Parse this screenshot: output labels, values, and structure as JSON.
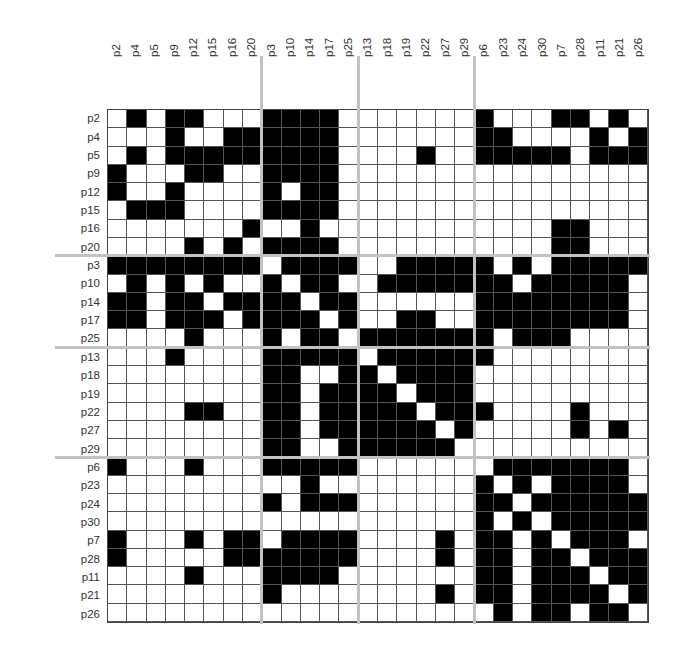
{
  "figure": {
    "type": "block-ordered binary adjacency matrix",
    "order": [
      "p2",
      "p4",
      "p5",
      "p9",
      "p12",
      "p15",
      "p16",
      "p20",
      "p3",
      "p10",
      "p14",
      "p17",
      "p25",
      "p13",
      "p18",
      "p19",
      "p22",
      "p27",
      "p29",
      "p6",
      "p23",
      "p24",
      "p30",
      "p7",
      "p28",
      "p11",
      "p21",
      "p26"
    ],
    "blocks": [
      {
        "start": 0,
        "size": 8
      },
      {
        "start": 8,
        "size": 5
      },
      {
        "start": 13,
        "size": 6
      },
      {
        "start": 19,
        "size": 9
      }
    ],
    "colors": {
      "filled": "#000000",
      "empty": "#ffffff",
      "separator": "#c2c2c2",
      "grid": "#555555"
    },
    "matrix": [
      "0101100011110000000100011010",
      "0001001111110000000110000101",
      "0101111111110000100111110111",
      "1000110011110000000000000000",
      "1001000010110000000000000000",
      "0111000011110000000000000000",
      "0000000100100000000000011000",
      "0000101011110000000000011000",
      "1111111101111001111101011111",
      "0101010010110011111110111110",
      "1101101111011000000111111110",
      "1101110111101001100111111110",
      "0000100010110111111101110000",
      "0001000011111011111100000000",
      "0000000011001101111000000000",
      "0000000011011110111000000000",
      "0000110011011111011100001000",
      "0000000011011111101000001010",
      "0000000011001111110000000000",
      "1000100011111000000011111110",
      "0000000000100000000101011110",
      "0000000010111000000110111111",
      "0000000000000000000101011111",
      "1000101101111000010110101110",
      "1000001111111000010110110111",
      "0000100011110000000110111011",
      "0000000010000000010110111101",
      "0000000000000000000010110110"
    ]
  },
  "caption": ""
}
